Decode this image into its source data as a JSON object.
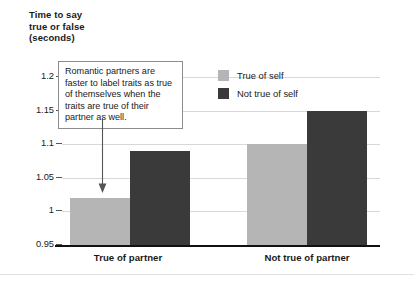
{
  "chart_data": {
    "type": "bar",
    "title": "",
    "ylabel": "Time to say true or false (seconds)",
    "xlabel": "",
    "categories": [
      "True of partner",
      "Not true of partner"
    ],
    "series": [
      {
        "name": "True of self",
        "color": "#b5b5b5",
        "values": [
          1.02,
          1.1
        ]
      },
      {
        "name": "Not true of self",
        "color": "#3a3a3a",
        "values": [
          1.09,
          1.15
        ]
      }
    ],
    "ylim": [
      0.95,
      1.2
    ],
    "yticks": [
      "1.2",
      "1.15",
      "1.1",
      "1.05",
      "1",
      "0.95"
    ],
    "ytick_values": [
      1.2,
      1.15,
      1.1,
      1.05,
      1.0,
      0.95
    ],
    "grid": true,
    "legend_position": "top-right",
    "annotations": [
      {
        "text": "Romantic partners are faster to label traits as true of themselves when the traits are true of their partner as well.",
        "points_to": "True of partner / True of self bar"
      }
    ]
  },
  "axis": {
    "y_title_line1": "Time to say",
    "y_title_line2": "true or false",
    "y_title_line3": "(seconds)",
    "y_title": "Time to say\ntrue or false\n(seconds)"
  },
  "legend": {
    "items": [
      {
        "label": "True of self"
      },
      {
        "label": "Not true of self"
      }
    ]
  },
  "xaxis": {
    "labels": [
      {
        "text": "True of partner"
      },
      {
        "text": "Not true of partner"
      }
    ]
  },
  "annotation": {
    "text": "Romantic partners are faster to label traits as true of themselves when the traits are true of their partner as well."
  },
  "colors": {
    "light_bar": "#b5b5b5",
    "dark_bar": "#3a3a3a",
    "gridline": "#d8d8d8",
    "axis": "#111111",
    "text": "#1a1a1a"
  }
}
